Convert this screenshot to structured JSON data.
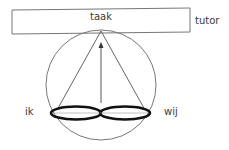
{
  "diagram": {
    "type": "conceptual-triangle-model",
    "labels": {
      "task": "taak",
      "tutor": "tutor",
      "self": "ik",
      "group": "wij"
    },
    "colors": {
      "stroke": "#777777",
      "ellipse_stroke": "#111111",
      "text": "#3a3a3a",
      "background": "#ffffff"
    },
    "elements": {
      "task_box": {
        "x": 12,
        "y": 9,
        "width": 178,
        "height": 25,
        "slight_tilt": true
      },
      "circle": {
        "cx": 101,
        "cy": 85,
        "r": 55
      },
      "triangle": {
        "apex": [
          101,
          31
        ],
        "left": [
          57,
          110
        ],
        "right": [
          145,
          110
        ]
      },
      "arrow": {
        "from": [
          101,
          103
        ],
        "to": [
          101,
          44
        ],
        "direction": "up"
      },
      "ellipses": [
        {
          "cx": 76,
          "cy": 113,
          "rx": 25,
          "ry": 6.5,
          "label": "ik"
        },
        {
          "cx": 125,
          "cy": 113,
          "rx": 25,
          "ry": 6.5,
          "label": "wij"
        }
      ]
    }
  }
}
